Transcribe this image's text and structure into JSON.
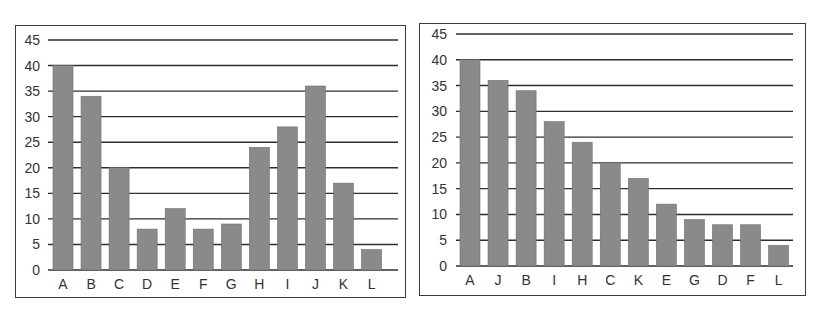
{
  "chart_data": [
    {
      "type": "bar",
      "title": "",
      "xlabel": "",
      "ylabel": "",
      "categories": [
        "A",
        "B",
        "C",
        "D",
        "E",
        "F",
        "G",
        "H",
        "I",
        "J",
        "K",
        "L"
      ],
      "values": [
        40,
        34,
        20,
        8,
        12,
        8,
        9,
        24,
        28,
        36,
        17,
        4
      ],
      "ylim": [
        0,
        45
      ],
      "yticks": [
        0,
        5,
        10,
        15,
        20,
        25,
        30,
        35,
        40,
        45
      ],
      "grid": true,
      "legend": null,
      "bar_color": "#8a8a8a"
    },
    {
      "type": "bar",
      "title": "",
      "xlabel": "",
      "ylabel": "",
      "categories": [
        "A",
        "J",
        "B",
        "I",
        "H",
        "C",
        "K",
        "E",
        "G",
        "D",
        "F",
        "L"
      ],
      "values": [
        40,
        36,
        34,
        28,
        24,
        20,
        17,
        12,
        9,
        8,
        8,
        4
      ],
      "ylim": [
        0,
        45
      ],
      "yticks": [
        0,
        5,
        10,
        15,
        20,
        25,
        30,
        35,
        40,
        45
      ],
      "grid": true,
      "legend": null,
      "bar_color": "#8a8a8a"
    }
  ],
  "colors": {
    "bar": "#8a8a8a",
    "gridline": "#2e2e2e",
    "frame": "#3a3a3a",
    "text": "#333333"
  }
}
